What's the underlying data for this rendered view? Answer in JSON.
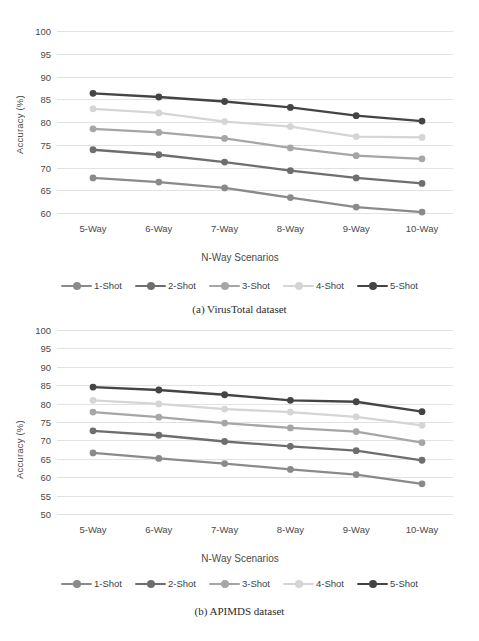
{
  "figure": {
    "series_colors": {
      "1-Shot": "#8a8a8a",
      "2-Shot": "#6e6e6e",
      "3-Shot": "#a6a6a6",
      "4-Shot": "#d5d5d5",
      "5-Shot": "#444444"
    },
    "grid_color": "#e2e2e2",
    "text_color": "#4a4a4a"
  },
  "panel_a": {
    "caption": "(a) VirusTotal dataset",
    "legend": [
      "1-Shot",
      "2-Shot",
      "3-Shot",
      "4-Shot",
      "5-Shot"
    ]
  },
  "panel_b": {
    "caption": "(b) APIMDS dataset",
    "legend": [
      "1-Shot",
      "2-Shot",
      "3-Shot",
      "4-Shot",
      "5-Shot"
    ]
  },
  "chart_data": [
    {
      "id": "panel_a",
      "type": "line",
      "title": "(a) VirusTotal dataset",
      "xlabel": "N-Way Scenarios",
      "ylabel": "Accuracy (%)",
      "categories": [
        "5-Way",
        "6-Way",
        "7-Way",
        "8-Way",
        "9-Way",
        "10-Way"
      ],
      "ylim": [
        60,
        100
      ],
      "yticks": [
        60,
        65,
        70,
        75,
        80,
        85,
        90,
        95,
        100
      ],
      "grid": true,
      "legend_position": "bottom",
      "series": [
        {
          "name": "1-Shot",
          "color": "#8a8a8a",
          "values": [
            67.7,
            66.8,
            65.5,
            63.4,
            61.3,
            60.2
          ]
        },
        {
          "name": "2-Shot",
          "color": "#6e6e6e",
          "values": [
            73.9,
            72.8,
            71.2,
            69.3,
            67.7,
            66.5
          ]
        },
        {
          "name": "3-Shot",
          "color": "#a6a6a6",
          "values": [
            78.5,
            77.7,
            76.4,
            74.3,
            72.6,
            71.9
          ]
        },
        {
          "name": "4-Shot",
          "color": "#d5d5d5",
          "values": [
            82.9,
            82.0,
            80.1,
            79.0,
            76.8,
            76.6
          ]
        },
        {
          "name": "5-Shot",
          "color": "#444444",
          "values": [
            86.3,
            85.5,
            84.5,
            83.2,
            81.4,
            80.2
          ]
        }
      ]
    },
    {
      "id": "panel_b",
      "type": "line",
      "title": "(b) APIMDS dataset",
      "xlabel": "N-Way Scenarios",
      "ylabel": "Accuracy (%)",
      "categories": [
        "5-Way",
        "6-Way",
        "7-Way",
        "8-Way",
        "9-Way",
        "10-Way"
      ],
      "ylim": [
        50,
        100
      ],
      "yticks": [
        50,
        55,
        60,
        65,
        70,
        75,
        80,
        85,
        90,
        95,
        100
      ],
      "grid": true,
      "legend_position": "bottom",
      "series": [
        {
          "name": "1-Shot",
          "color": "#8a8a8a",
          "values": [
            66.6,
            65.1,
            63.7,
            62.1,
            60.7,
            58.2
          ]
        },
        {
          "name": "2-Shot",
          "color": "#6e6e6e",
          "values": [
            72.6,
            71.4,
            69.7,
            68.4,
            67.2,
            64.6
          ]
        },
        {
          "name": "3-Shot",
          "color": "#a6a6a6",
          "values": [
            77.7,
            76.3,
            74.7,
            73.4,
            72.4,
            69.4
          ]
        },
        {
          "name": "4-Shot",
          "color": "#d5d5d5",
          "values": [
            80.9,
            79.9,
            78.5,
            77.7,
            76.4,
            74.1
          ]
        },
        {
          "name": "5-Shot",
          "color": "#444444",
          "values": [
            84.5,
            83.7,
            82.4,
            80.9,
            80.5,
            77.8
          ]
        }
      ]
    }
  ]
}
